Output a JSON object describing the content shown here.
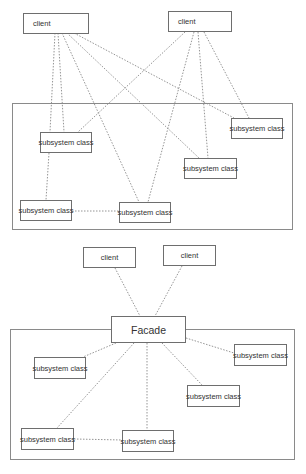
{
  "top_diagram": {
    "title": "Without facade",
    "clients": [
      {
        "label": "client",
        "x": 23,
        "y": 13,
        "w": 66,
        "h": 21
      },
      {
        "label": "client",
        "x": 168,
        "y": 11,
        "w": 64,
        "h": 21
      }
    ],
    "subsystem_frame": {
      "x": 12,
      "y": 103,
      "w": 281,
      "h": 127
    },
    "subsystems": [
      {
        "label": "subsystem class",
        "x": 40,
        "y": 132,
        "w": 52,
        "h": 21
      },
      {
        "label": "subsystem class",
        "x": 231,
        "y": 118,
        "w": 52,
        "h": 21
      },
      {
        "label": "subsystem class",
        "x": 184,
        "y": 158,
        "w": 53,
        "h": 21
      },
      {
        "label": "subsystem class",
        "x": 20,
        "y": 200,
        "w": 52,
        "h": 21
      },
      {
        "label": "subsystem class",
        "x": 119,
        "y": 202,
        "w": 52,
        "h": 21
      }
    ]
  },
  "bottom_diagram": {
    "title": "With facade",
    "clients": [
      {
        "label": "client",
        "x": 83,
        "y": 247,
        "w": 53,
        "h": 21
      },
      {
        "label": "client",
        "x": 163,
        "y": 245,
        "w": 53,
        "h": 21
      }
    ],
    "facade": {
      "label": "Facade",
      "x": 111,
      "y": 316,
      "w": 75,
      "h": 27
    },
    "subsystem_frame": {
      "x": 10,
      "y": 329,
      "w": 285,
      "h": 131
    },
    "subsystems": [
      {
        "label": "subsystem class",
        "x": 34,
        "y": 357,
        "w": 52,
        "h": 22
      },
      {
        "label": "subsystem class",
        "x": 234,
        "y": 344,
        "w": 53,
        "h": 22
      },
      {
        "label": "subsystem class",
        "x": 187,
        "y": 385,
        "w": 53,
        "h": 22
      },
      {
        "label": "subsystem class",
        "x": 21,
        "y": 428,
        "w": 53,
        "h": 22
      },
      {
        "label": "subsystem class",
        "x": 122,
        "y": 430,
        "w": 52,
        "h": 22
      }
    ]
  },
  "colors": {
    "line": "#7a7a7a",
    "border": "#6e6e6e",
    "text": "#333333"
  }
}
